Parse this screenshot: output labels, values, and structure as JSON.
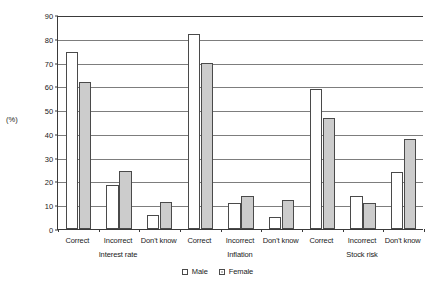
{
  "chart_data": {
    "type": "bar",
    "title": "",
    "xlabel": "",
    "ylabel": "(%)",
    "ylim": [
      0,
      90
    ],
    "yticks": [
      0,
      10,
      20,
      30,
      40,
      50,
      60,
      70,
      80,
      90
    ],
    "grid": true,
    "legend_position": "bottom-center",
    "groups": [
      "Interest rate",
      "Inflation",
      "Stock risk"
    ],
    "categories": [
      "Correct",
      "Incorrect",
      "Don't know",
      "Correct",
      "Incorrect",
      "Don't know",
      "Correct",
      "Incorrect",
      "Don't know"
    ],
    "series": [
      {
        "name": "Male",
        "color": "#ffffff",
        "values": [
          74.5,
          18.5,
          6.0,
          82.0,
          11.0,
          5.0,
          59.0,
          14.0,
          24.0
        ]
      },
      {
        "name": "Female",
        "color": "#cccccc",
        "values": [
          62.0,
          24.5,
          11.5,
          70.0,
          14.0,
          12.0,
          46.5,
          11.0,
          38.0
        ]
      }
    ]
  },
  "axis": {
    "y_label": "(%)"
  },
  "legend": {
    "items": [
      {
        "label": "Male"
      },
      {
        "label": "Female"
      }
    ]
  }
}
